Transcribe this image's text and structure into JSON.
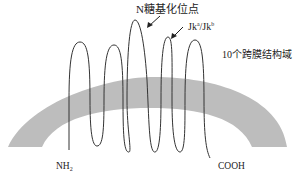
{
  "diagram": {
    "type": "membrane-protein-topology",
    "labels": {
      "glycosylation_site": "N糖基化位点",
      "jk_antigen_base": "Jk",
      "jk_a_sup": "a",
      "jk_sep": "/Jk",
      "jk_b_sup": "b",
      "transmembrane_domains": "10个跨膜结构域",
      "n_terminus_base": "NH",
      "n_terminus_sub": "2",
      "c_terminus": "COOH"
    },
    "colors": {
      "membrane": "#bdbdbd",
      "strand": "#333333",
      "text": "#222222"
    },
    "transmembrane_count": 10
  }
}
